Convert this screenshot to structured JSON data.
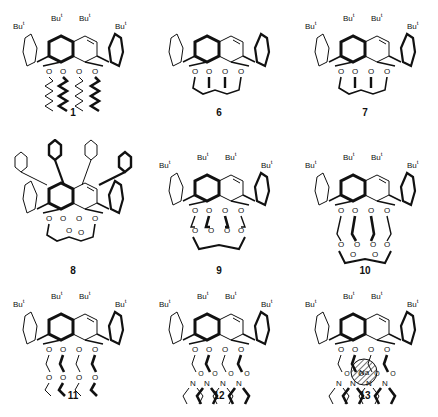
{
  "figure": {
    "compounds": [
      {
        "id": "1",
        "label": "1",
        "substituents": [
          "Bu^t",
          "Bu^t",
          "Bu^t",
          "Bu^t"
        ],
        "description": "calixarene with four O-alkyl chains"
      },
      {
        "id": "6",
        "label": "6",
        "substituents": [],
        "description": "calixarene crown (unsubstituted upper rim)"
      },
      {
        "id": "7",
        "label": "7",
        "substituents": [
          "Bu^t",
          "Bu^t",
          "Bu^t",
          "Bu^t"
        ],
        "description": "calixarene crown"
      },
      {
        "id": "8",
        "label": "8",
        "substituents": [
          "cyclohexyl",
          "cyclohexyl",
          "cyclohexyl",
          "cyclohexyl"
        ],
        "description": "calixarene crown with cyclohexyl groups"
      },
      {
        "id": "9",
        "label": "9",
        "substituents": [
          "Bu^t",
          "Bu^t",
          "Bu^t",
          "Bu^t"
        ],
        "description": "calixarene bis-crown"
      },
      {
        "id": "10",
        "label": "10",
        "substituents": [
          "Bu^t",
          "Bu^t",
          "Bu^t",
          "Bu^t"
        ],
        "description": "calixarene bis-crown extended"
      },
      {
        "id": "11",
        "label": "11",
        "substituents": [
          "Bu^t",
          "Bu^t",
          "Bu^t",
          "Bu^t"
        ],
        "description": "calixarene tetra-ethoxyethyl ether"
      },
      {
        "id": "12",
        "label": "12",
        "substituents": [
          "Bu^t",
          "Bu^t",
          "Bu^t",
          "Bu^t"
        ],
        "description": "calixarene tetra(diethylamide)"
      },
      {
        "id": "13",
        "label": "13",
        "substituents": [
          "Bu^t",
          "Bu^t",
          "Bu^t",
          "Bu^t"
        ],
        "description": "calixarene tetra(diethylamide) Na+ complex",
        "ion": "Na"
      }
    ],
    "bu_label": "Bu",
    "bu_sup": "t",
    "atom_O": "O",
    "atom_N": "N",
    "ion_label": "Na"
  }
}
